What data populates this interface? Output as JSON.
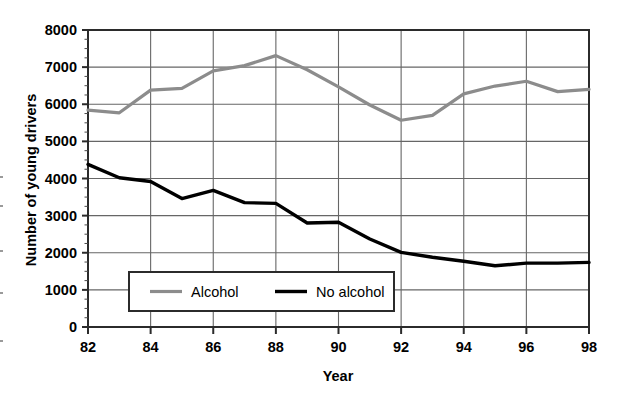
{
  "chart_data": {
    "type": "line",
    "title": "",
    "xlabel": "Year",
    "ylabel": "Number of young drivers",
    "x": [
      82,
      83,
      84,
      85,
      86,
      87,
      88,
      89,
      90,
      91,
      92,
      93,
      94,
      95,
      96,
      97,
      98
    ],
    "xtick_labels": [
      "82",
      "84",
      "86",
      "88",
      "90",
      "92",
      "94",
      "96",
      "98"
    ],
    "xticks": [
      82,
      84,
      86,
      88,
      90,
      92,
      94,
      96,
      98
    ],
    "xlim": [
      82,
      98
    ],
    "ytick_labels": [
      "0",
      "1000",
      "2000",
      "3000",
      "4000",
      "5000",
      "6000",
      "7000",
      "8000"
    ],
    "yticks": [
      0,
      1000,
      2000,
      3000,
      4000,
      5000,
      6000,
      7000,
      8000
    ],
    "ylim": [
      0,
      8000
    ],
    "grid": true,
    "legend_position": "lower-center-inside",
    "series": [
      {
        "name": "Alcohol",
        "color": "#8c8c8c",
        "width": 3.2,
        "values": [
          5840,
          5770,
          6380,
          6430,
          6900,
          7040,
          7310,
          6930,
          6470,
          5980,
          5570,
          5700,
          6280,
          6490,
          6620,
          6340,
          6400
        ]
      },
      {
        "name": "No alcohol",
        "color": "#000000",
        "width": 3.4,
        "values": [
          4380,
          4020,
          3920,
          3460,
          3680,
          3350,
          3330,
          2800,
          2820,
          2370,
          2010,
          1880,
          1770,
          1650,
          1720,
          1720,
          1740
        ]
      }
    ]
  },
  "axes": {
    "x_title": "Year",
    "y_title": "Number of young drivers"
  },
  "legend": {
    "items": [
      {
        "label": "Alcohol",
        "color": "#8c8c8c"
      },
      {
        "label": "No alcohol",
        "color": "#000000"
      }
    ]
  },
  "style": {
    "grid_color": "#666666",
    "frame_color": "#2b2b2b",
    "background": "#ffffff"
  },
  "edge_marks": [
    {
      "top": 176
    },
    {
      "top": 205
    },
    {
      "top": 250
    },
    {
      "top": 292
    },
    {
      "top": 340
    }
  ]
}
